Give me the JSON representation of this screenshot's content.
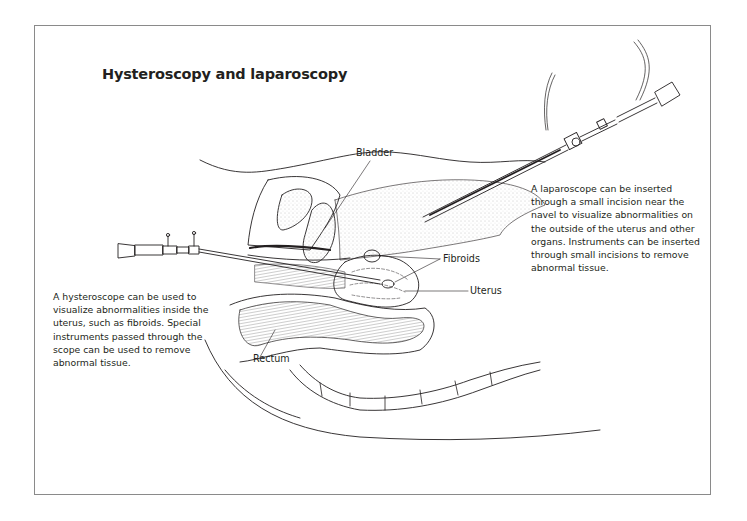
{
  "figure": {
    "title": "Hysteroscopy and laparoscopy",
    "labels": {
      "bladder": "Bladder",
      "fibroids": "Fibroids",
      "uterus": "Uterus",
      "rectum": "Rectum"
    },
    "captions": {
      "laparoscope": [
        "A laparoscope can be inserted",
        "through a small incision near the",
        "navel to visualize abnormalities on",
        "the outside of the uterus and other",
        "organs. Instruments can be inserted",
        "through small incisions to remove",
        "abnormal tissue."
      ],
      "hysteroscope": [
        "A hysteroscope can be used to",
        "visualize abnormalities inside the",
        "uterus, such as fibroids. Special",
        "instruments passed through the",
        "scope can be used to remove",
        "abnormal tissue."
      ]
    },
    "instruments": [
      "laparoscope",
      "hysteroscope"
    ],
    "colors": {
      "line": "#231f20",
      "frame": "#8a8a8a",
      "stipple": "#b8b8b8",
      "background": "#ffffff"
    }
  }
}
